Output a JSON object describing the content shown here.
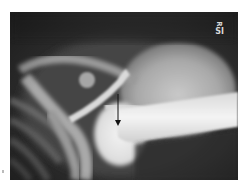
{
  "image": {
    "type": "radiograph",
    "subject": "shoulder",
    "description": "Frontal shoulder X-ray with arrow pointing to glenohumeral region",
    "marker": {
      "line1": "R",
      "line2": "SI"
    },
    "annotation": {
      "type": "arrow",
      "direction": "down",
      "color": "#111111"
    },
    "colors": {
      "background": "#ffffff",
      "film_dark": "#2a2a2a",
      "bone_bright": "#f2f2f2",
      "soft_tissue": "#8a8a8a"
    }
  }
}
